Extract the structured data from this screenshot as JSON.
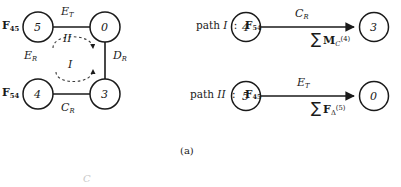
{
  "figure": {
    "caption": "(a)",
    "left_graph": {
      "name": "state-transition-graph",
      "nodes": [
        {
          "id": "n5",
          "label": "5",
          "cx": 38,
          "cy": 27
        },
        {
          "id": "n0",
          "label": "0",
          "cx": 105,
          "cy": 27
        },
        {
          "id": "n4",
          "label": "4",
          "cx": 38,
          "cy": 94
        },
        {
          "id": "n3",
          "label": "3",
          "cx": 105,
          "cy": 94
        }
      ],
      "node_tags": [
        {
          "base": "F",
          "sub": "45",
          "x": 2,
          "y": 20
        },
        {
          "base": "F",
          "sub": "54",
          "x": 2,
          "y": 87
        }
      ],
      "edge_labels": [
        {
          "base": "E",
          "sub": "T",
          "x": 61,
          "y": 8
        },
        {
          "base": "D",
          "sub": "R",
          "x": 113,
          "y": 52
        },
        {
          "base": "C",
          "sub": "R",
          "x": 61,
          "y": 104
        },
        {
          "base": "E",
          "sub": "R",
          "x": 24,
          "y": 52
        }
      ],
      "loop_labels": [
        {
          "text": "II",
          "x": 63,
          "y": 39
        },
        {
          "text": "I",
          "x": 67,
          "y": 64
        }
      ]
    },
    "paths": [
      {
        "prefix": "path",
        "roman": "I",
        "colon": ":",
        "tag": {
          "base": "F",
          "sub": "54"
        },
        "from_node": "4",
        "to_node": "3",
        "above": {
          "base": "C",
          "sub": "R"
        },
        "below": {
          "sigma": "∑",
          "base": "M",
          "sub": "C",
          "sup": "(4)"
        }
      },
      {
        "prefix": "path",
        "roman": "II",
        "colon": ":",
        "tag": {
          "base": "F",
          "sub": "45"
        },
        "from_node": "5",
        "to_node": "0",
        "above": {
          "base": "E",
          "sub": "T"
        },
        "below": {
          "sigma": "∑",
          "base": "F",
          "sub": "Δ",
          "sup": "(5)"
        }
      }
    ],
    "colors": {
      "ink": "#1a1a1a",
      "background": "#ffffff",
      "faint": "#c9c9c9"
    }
  }
}
